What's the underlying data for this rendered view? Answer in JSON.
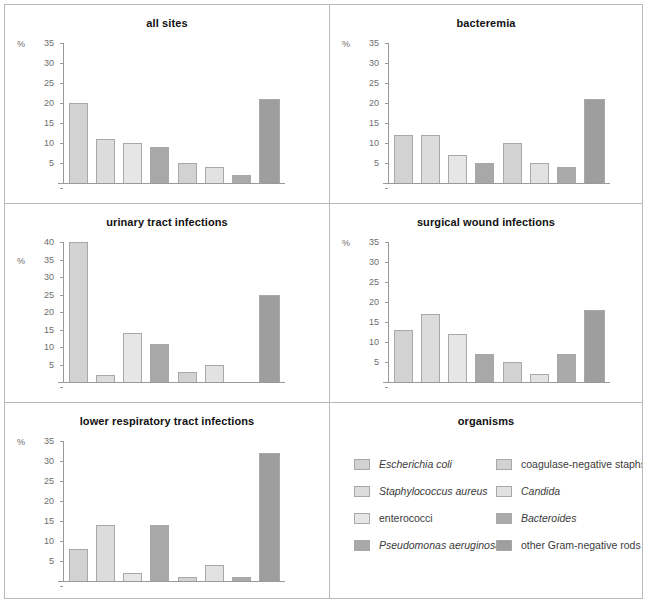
{
  "figure": {
    "axis_unit": "%",
    "organisms": [
      {
        "name": "Escherichia coli",
        "italic": true,
        "color": "#d2d2d2"
      },
      {
        "name": "Staphylococcus aureus",
        "italic": true,
        "color": "#dcdcdc"
      },
      {
        "name": "enterococci",
        "italic": false,
        "color": "#e6e6e6"
      },
      {
        "name": "Pseudomonas aeruginosa",
        "italic": true,
        "color": "#a8a8a8"
      },
      {
        "name": "coagulase-negative staphs",
        "italic": false,
        "color": "#d2d2d2"
      },
      {
        "name": "Candida",
        "italic": true,
        "color": "#e2e2e2"
      },
      {
        "name": "Bacteroides",
        "italic": true,
        "color": "#aaaaaa"
      },
      {
        "name": "other Gram-negative rods",
        "italic": false,
        "color": "#9e9e9e"
      }
    ],
    "legend_title": "organisms"
  },
  "chart_data": [
    {
      "type": "bar",
      "title": "all sites",
      "ylabel": "%",
      "ylim": [
        0,
        35
      ],
      "yticks": [
        5,
        10,
        15,
        20,
        25,
        30,
        35
      ],
      "categories": [
        "Escherichia coli",
        "Staphylococcus aureus",
        "enterococci",
        "Pseudomonas aeruginosa",
        "coagulase-negative staphs",
        "Candida",
        "Bacteroides",
        "other Gram-negative rods"
      ],
      "values": [
        20,
        11,
        10,
        9,
        5,
        4,
        2,
        21
      ]
    },
    {
      "type": "bar",
      "title": "bacteremia",
      "ylabel": "%",
      "ylim": [
        0,
        35
      ],
      "yticks": [
        5,
        10,
        15,
        20,
        25,
        30,
        35
      ],
      "categories": [
        "Escherichia coli",
        "Staphylococcus aureus",
        "enterococci",
        "Pseudomonas aeruginosa",
        "coagulase-negative staphs",
        "Candida",
        "Bacteroides",
        "other Gram-negative rods"
      ],
      "values": [
        12,
        12,
        7,
        5,
        10,
        5,
        4,
        21
      ]
    },
    {
      "type": "bar",
      "title": "urinary tract infections",
      "ylabel": "%",
      "ylim": [
        0,
        40
      ],
      "yticks": [
        5,
        10,
        15,
        20,
        25,
        30,
        35,
        40
      ],
      "categories": [
        "Escherichia coli",
        "Staphylococcus aureus",
        "enterococci",
        "Pseudomonas aeruginosa",
        "coagulase-negative staphs",
        "Candida",
        "Bacteroides",
        "other Gram-negative rods"
      ],
      "values": [
        40,
        2,
        14,
        11,
        3,
        5,
        0,
        25
      ]
    },
    {
      "type": "bar",
      "title": "surgical wound infections",
      "ylabel": "%",
      "ylim": [
        0,
        35
      ],
      "yticks": [
        5,
        10,
        15,
        20,
        25,
        30,
        35
      ],
      "categories": [
        "Escherichia coli",
        "Staphylococcus aureus",
        "enterococci",
        "Pseudomonas aeruginosa",
        "coagulase-negative staphs",
        "Candida",
        "Bacteroides",
        "other Gram-negative rods"
      ],
      "values": [
        13,
        17,
        12,
        7,
        5,
        2,
        7,
        18
      ]
    },
    {
      "type": "bar",
      "title": "lower respiratory tract infections",
      "ylabel": "%",
      "ylim": [
        0,
        35
      ],
      "yticks": [
        5,
        10,
        15,
        20,
        25,
        30,
        35
      ],
      "categories": [
        "Escherichia coli",
        "Staphylococcus aureus",
        "enterococci",
        "Pseudomonas aeruginosa",
        "coagulase-negative staphs",
        "Candida",
        "Bacteroides",
        "other Gram-negative rods"
      ],
      "values": [
        8,
        14,
        2,
        14,
        1,
        4,
        1,
        32
      ]
    }
  ]
}
